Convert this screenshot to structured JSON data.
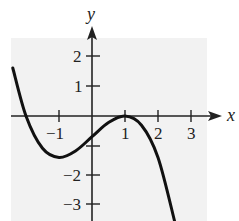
{
  "chart_data": {
    "type": "line",
    "title": "",
    "xlabel": "x",
    "ylabel": "y",
    "xlim": [
      -2.45,
      3.45
    ],
    "ylim": [
      -3.5,
      2.6
    ],
    "grid": false,
    "x_ticks": [
      -1,
      1,
      2,
      3
    ],
    "x_tick_labels": [
      "−1",
      "1",
      "2",
      "3"
    ],
    "y_ticks": [
      2,
      1,
      -2,
      -3
    ],
    "y_tick_labels": [
      "2",
      "1",
      "−2",
      "−3"
    ],
    "unlabeled_ticks": {
      "x": [],
      "y": [
        -1
      ]
    },
    "series": [
      {
        "name": "f(x)",
        "description": "cubic with zero near x=-2, local min near (-1,-1.4), double root / local max at (1,0), decreasing after",
        "x": [
          -2.4,
          -2.0,
          -1.5,
          -1.0,
          -0.5,
          0.0,
          0.5,
          1.0,
          1.5,
          2.0,
          2.5
        ],
        "y": [
          1.62,
          0.0,
          -1.09,
          -1.4,
          -1.18,
          -0.7,
          -0.22,
          0.0,
          -0.31,
          -1.4,
          -3.54
        ]
      }
    ],
    "background": "#f2f2f2",
    "line_color": "#111111"
  }
}
